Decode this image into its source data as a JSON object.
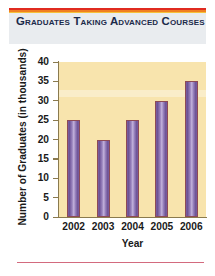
{
  "chart_data": {
    "type": "bar",
    "title": "Graduates Taking Advanced Courses",
    "categories": [
      "2002",
      "2003",
      "2004",
      "2005",
      "2006"
    ],
    "values": [
      25,
      20,
      25,
      30,
      35
    ],
    "xlabel": "Year",
    "ylabel": "Number of Graduates (in thousands)",
    "ylim": [
      0,
      40
    ],
    "ytick_labels": [
      "40",
      "35",
      "30",
      "25",
      "20",
      "15",
      "10",
      "5",
      "0"
    ],
    "ytick_values": [
      40,
      35,
      30,
      25,
      20,
      15,
      10,
      5,
      0
    ],
    "ystep": 5,
    "grid": false,
    "legend": null
  },
  "colors": {
    "plot_background": "#f8e4ad",
    "bar_fill_light": "#c3b2dc",
    "bar_fill_dark": "#6d5296",
    "bar_outline": "#8e4a55",
    "axis": "#8a7a4e",
    "title_text": "#1b2a4a",
    "header_background": "#e9ecef",
    "rule_red": "#e02b20",
    "rule_orange": "#f07f22",
    "rule_yellow": "#f5c23a",
    "rule_bottom": "#d36a7e",
    "page_background": "#ffffff"
  }
}
